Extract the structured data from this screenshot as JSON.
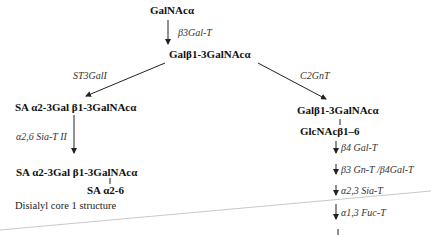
{
  "nodes": {
    "galnac": "GalNAcα",
    "core1": "Galβ1-3GalNAcα",
    "sialyl_core1": "SA α2-3Gal β1-3GalNAcα",
    "disialyl_main": "SA α2-3Gal β1-3GalNAcα",
    "disialyl_branch": "SA α2-6",
    "core2_main": "Galβ1-3GalNAcα",
    "core2_branch": "GlcNAcβ1–6"
  },
  "enzymes": {
    "b3galt": "β3Gal-T",
    "st3gal1": "ST3GalI",
    "c2gnt": "C2GnT",
    "a26siat2": "α2,6 Sia-T II",
    "b4galt": "β4 Gal-T",
    "b3gnt_b4galt": "β3 Gn-T /β4Gal-T",
    "a23siat": "α2,3 Sia-T",
    "a13fuct": "α1,3 Fuc-T"
  },
  "captions": {
    "disialyl": "Disialyl core 1 structure"
  },
  "colors": {
    "arrow": "#222222",
    "divider": "#bbbbbb"
  }
}
